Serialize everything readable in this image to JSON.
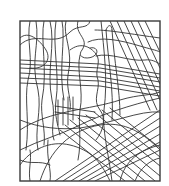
{
  "artwork": {
    "type": "abstract line drawing",
    "description": "Framed pattern of intersecting straight and curved black lines on white, resembling a street grid",
    "stroke_color": "#333333",
    "background_color": "#ffffff",
    "frame": {
      "x": 20,
      "y": 21,
      "width": 140,
      "height": 160
    }
  }
}
